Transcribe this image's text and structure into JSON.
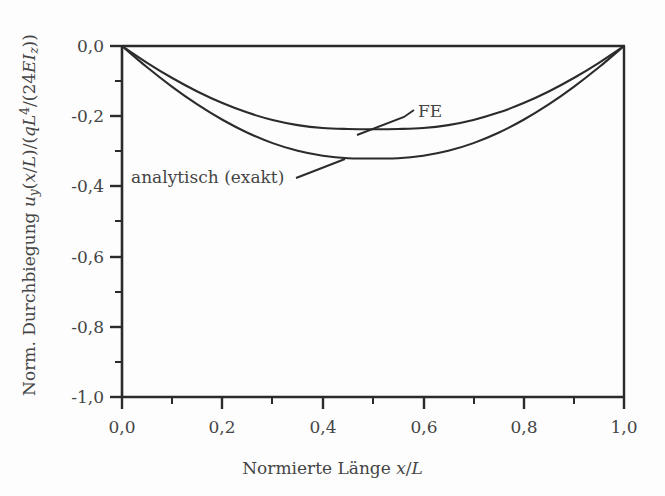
{
  "chart_data": {
    "type": "line",
    "title": "",
    "xlabel": "Normierte Länge x/L",
    "ylabel": "Norm. Durchbiegung u_y(x/L)/(qL^4/(24EI_z))",
    "xlim": [
      0.0,
      1.0
    ],
    "ylim": [
      -1.0,
      0.0
    ],
    "grid": false,
    "legend_position": "inline-annotations",
    "x_major_ticks": [
      0.0,
      0.2,
      0.4,
      0.6,
      0.8,
      1.0
    ],
    "x_minor_ticks": [
      0.1,
      0.3,
      0.5,
      0.7,
      0.9
    ],
    "y_major_ticks": [
      0.0,
      -0.2,
      -0.4,
      -0.6,
      -0.8,
      -1.0
    ],
    "y_minor_ticks": [
      -0.1,
      -0.3,
      -0.5,
      -0.7,
      -0.9
    ],
    "x_tick_labels": [
      "0,0",
      "0,2",
      "0,4",
      "0,6",
      "0,8",
      "1,0"
    ],
    "y_tick_labels": [
      "0,0",
      "-0,2",
      "-0,4",
      "-0,6",
      "-0,8",
      "-1,0"
    ],
    "x": [
      0.0,
      0.05,
      0.1,
      0.15,
      0.2,
      0.25,
      0.3,
      0.35,
      0.4,
      0.45,
      0.5,
      0.55,
      0.6,
      0.65,
      0.7,
      0.75,
      0.8,
      0.85,
      0.9,
      0.95,
      1.0
    ],
    "series": [
      {
        "name": "FE",
        "annotation_label": "FE",
        "minimum_value": -0.257,
        "minimum_at_x": 0.5,
        "values": [
          0.0,
          -0.0478,
          -0.0912,
          -0.1296,
          -0.1626,
          -0.1898,
          -0.2108,
          -0.2254,
          -0.2338,
          -0.2364,
          -0.237,
          -0.2364,
          -0.2338,
          -0.2254,
          -0.2108,
          -0.1898,
          -0.1626,
          -0.1296,
          -0.0912,
          -0.0478,
          0.0
        ]
      },
      {
        "name": "analytisch (exakt)",
        "annotation_label": "analytisch (exakt)",
        "minimum_value": -0.3125,
        "minimum_at_x": 0.5,
        "values": [
          0.0,
          -0.0607,
          -0.1164,
          -0.1665,
          -0.2102,
          -0.2471,
          -0.2767,
          -0.2987,
          -0.3128,
          -0.32,
          -0.3205,
          -0.32,
          -0.3128,
          -0.2987,
          -0.2767,
          -0.2471,
          -0.2102,
          -0.1665,
          -0.1164,
          -0.0607,
          0.0
        ]
      }
    ],
    "colors": {
      "curve": "#2b2b2b",
      "axis": "#2b2b2b",
      "background": "#fdfdfd",
      "text": "#454545"
    }
  },
  "axes": {
    "x_title_prefix": "Normierte Länge ",
    "x_title_var_x": "x",
    "x_title_slash": "/",
    "x_title_var_L": "L",
    "y_title_prefix": "Norm. Durchbiegung ",
    "y_title_u": "u",
    "y_title_u_sub": "y",
    "y_title_paren_open": "(",
    "y_title_x1": "x",
    "y_title_slash1": "/",
    "y_title_L1": "L",
    "y_title_mid": ")/(",
    "y_title_q": "q",
    "y_title_L2": "L",
    "y_title_L2_sup": "4",
    "y_title_slash2": "/(24",
    "y_title_E": "E",
    "y_title_I": "I",
    "y_title_I_sub": "z",
    "y_title_close": "))"
  },
  "annotations": {
    "fe": "FE",
    "analytic": "analytisch (exakt)"
  }
}
